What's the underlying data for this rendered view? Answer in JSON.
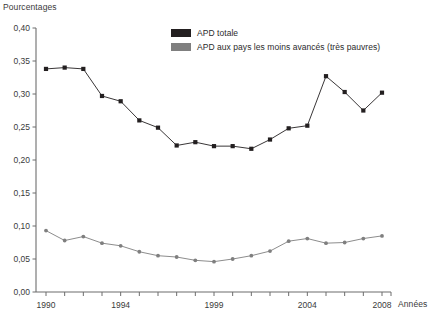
{
  "chart_data": {
    "type": "line",
    "title": "",
    "ylabel": "Pourcentages",
    "xlabel": "Années",
    "grid": false,
    "legend_position": "top-right",
    "ylim": [
      0.0,
      0.4
    ],
    "ytick_labels": [
      "0,40",
      "0,35",
      "0,30",
      "0,25",
      "0,20",
      "0,15",
      "0,10",
      "0,05",
      "0,00"
    ],
    "ytick_values": [
      0.4,
      0.35,
      0.3,
      0.25,
      0.2,
      0.15,
      0.1,
      0.05,
      0.0
    ],
    "xlim": [
      1990,
      2008
    ],
    "x": [
      1990,
      1991,
      1992,
      1993,
      1994,
      1995,
      1996,
      1997,
      1998,
      1999,
      2000,
      2001,
      2002,
      2003,
      2004,
      2005,
      2006,
      2007,
      2008
    ],
    "xtick_labels_shown": [
      "1990",
      "1994",
      "1999",
      "2004",
      "2008"
    ],
    "xtick_label_values": [
      1990,
      1994,
      1999,
      2004,
      2008
    ],
    "series": [
      {
        "name": "APD totale",
        "color": "#231f20",
        "values": [
          0.338,
          0.34,
          0.338,
          0.297,
          0.289,
          0.26,
          0.249,
          0.222,
          0.227,
          0.221,
          0.221,
          0.217,
          0.231,
          0.248,
          0.252,
          0.327,
          0.303,
          0.275,
          0.302
        ]
      },
      {
        "name": "APD aux pays les moins avancés (très pauvres)",
        "color": "#7f7f7f",
        "values": [
          0.093,
          0.078,
          0.084,
          0.074,
          0.07,
          0.061,
          0.055,
          0.053,
          0.048,
          0.046,
          0.05,
          0.055,
          0.062,
          0.077,
          0.081,
          0.074,
          0.075,
          0.081,
          0.085
        ]
      }
    ]
  },
  "legend": {
    "items": [
      {
        "label": "APD totale",
        "color": "#231f20"
      },
      {
        "label": "APD aux pays les moins avancés (très pauvres)",
        "color": "#7f7f7f"
      }
    ]
  },
  "axes": {
    "y_axis_title": "Pourcentages",
    "x_axis_title": "Années"
  },
  "colors": {
    "axis": "#6d6d6d",
    "series_total": "#231f20",
    "series_ldc": "#7f7f7f",
    "text": "#2b2b2b"
  }
}
